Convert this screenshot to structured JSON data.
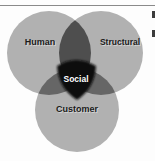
{
  "page": {
    "background": "#fdfdfd",
    "rule_color": "#8a8a8a",
    "fragment_color": "#3c3c3c"
  },
  "diagram": {
    "type": "venn",
    "circle_color": "#b1b1b1",
    "overlap_top_color": "#4e4e4e",
    "overlap_side_color": "#666666",
    "label_color": "#1b1b1b",
    "circles": [
      {
        "id": "human",
        "label": "Human"
      },
      {
        "id": "structural",
        "label": "Structural"
      },
      {
        "id": "customer",
        "label": "Customer"
      }
    ],
    "center": {
      "label": "Social",
      "color": "#101010",
      "text_color": "#ffffff"
    }
  }
}
